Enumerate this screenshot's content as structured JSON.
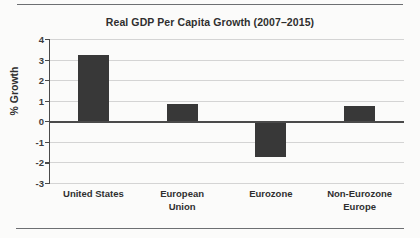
{
  "rules": {
    "top": "page-rule-top",
    "bottom": "page-rule-bottom"
  },
  "chart_data": {
    "type": "bar",
    "title": "Real GDP Per Capita Growth (2007–2015)",
    "xlabel": "",
    "ylabel": "% Growth",
    "ylim": [
      -3,
      4
    ],
    "ytick_step": 1,
    "yticks": [
      "4",
      "3",
      "2",
      "1",
      "0",
      "-1",
      "-2",
      "-3"
    ],
    "grid": true,
    "legend": false,
    "zero_line": true,
    "bar_color": "#383838",
    "categories": [
      "United States",
      "European Union",
      "Eurozone",
      "Non-Eurozone Europe"
    ],
    "category_lines": [
      [
        "United States"
      ],
      [
        "European",
        "Union"
      ],
      [
        "Eurozone"
      ],
      [
        "Non-Eurozone",
        "Europe"
      ]
    ],
    "values": [
      3.2,
      0.83,
      -1.75,
      0.72
    ]
  }
}
